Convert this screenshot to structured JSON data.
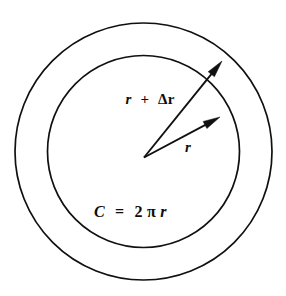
{
  "figure": {
    "name": "annulus-radius-diagram",
    "background_color": "#ffffff",
    "stroke_color": "#101010",
    "text_color": "#0d0d0d",
    "width": 286,
    "height": 296
  },
  "labels": {
    "outer_radius": {
      "full_text": "r + Δr",
      "var_r": "r",
      "plus": "+",
      "delta_r": "Δr",
      "x": 150,
      "y": 104,
      "font_size": 15
    },
    "inner_radius": {
      "full_text": "r",
      "var_r": "r",
      "x": 188,
      "y": 152,
      "font_size": 15
    },
    "circumference": {
      "full_text": "C = 2πr",
      "var_c": "C",
      "equals": "=",
      "coefficient": "2",
      "pi": "π",
      "var_r": "r",
      "x": 94,
      "y": 217,
      "font_size": 16
    }
  },
  "geometry": {
    "center": {
      "x": 143.5,
      "y": 151.5
    },
    "outer_circle": {
      "name": "outer-circle",
      "radius": 128.5,
      "cx": 143.5,
      "cy": 151.5
    },
    "inner_circle": {
      "name": "inner-circle",
      "radius": 96.0,
      "cx": 143.5,
      "cy": 151.5
    },
    "vertex": {
      "x": 144.0,
      "y": 157.5
    },
    "outer_vector": {
      "name": "outer-radius-vector",
      "from_x": 144.0,
      "from_y": 157.5,
      "to_x": 222.0,
      "to_y": 61.0,
      "angle_deg": -51.0,
      "head_length": 17,
      "head_width": 8
    },
    "inner_vector": {
      "name": "inner-radius-vector",
      "from_x": 144.0,
      "from_y": 157.5,
      "to_x": 220.0,
      "to_y": 117.0,
      "angle_deg": -28.0,
      "head_length": 17,
      "head_width": 8
    }
  },
  "chart_data": {
    "type": "diagram",
    "title": "",
    "elements": [
      {
        "kind": "circle",
        "label": "inner circle",
        "radius_symbol": "r",
        "annotation": "C = 2πr"
      },
      {
        "kind": "circle",
        "label": "outer circle",
        "radius_symbol": "r + Δr",
        "annotation": ""
      },
      {
        "kind": "vector",
        "label": "r",
        "from": "center",
        "to": "inner circle"
      },
      {
        "kind": "vector",
        "label": "r + Δr",
        "from": "center",
        "to": "outer circle"
      }
    ],
    "annotations": [
      "r",
      "r + Δr",
      "C = 2πr"
    ]
  }
}
